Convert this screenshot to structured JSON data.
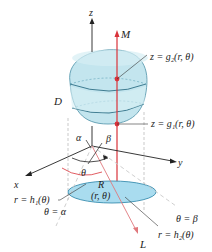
{
  "diagram": {
    "axes": {
      "z": "z",
      "x": "x",
      "y": "y"
    },
    "labels": {
      "M": "M",
      "L": "L",
      "D": "D",
      "R": "R",
      "point": "(r, θ)",
      "upper_surface": "z = g₂(r, θ)",
      "lower_surface": "z = g₁(r, θ)",
      "alpha": "α",
      "beta": "β",
      "theta": "θ",
      "inner_curve": "r = h₁(θ)",
      "outer_curve": "r = h₂(θ)",
      "ray_alpha": "θ = α",
      "ray_beta": "θ = β"
    },
    "colors": {
      "solid_fill": "#bfe3ec",
      "solid_stroke": "#3a7f96",
      "region_fill": "#a9dcef",
      "red_line": "#d9323a",
      "axis": "#222222",
      "dashed": "#b8b8b8"
    }
  }
}
